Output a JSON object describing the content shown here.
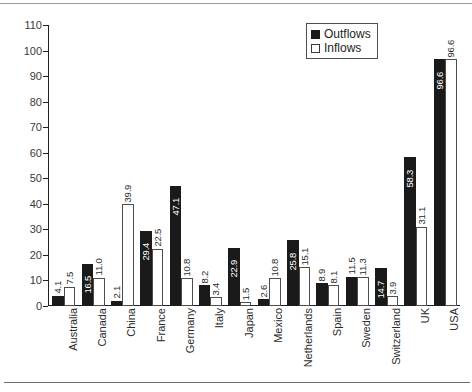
{
  "chart_data": {
    "type": "bar",
    "title": "",
    "subtitle": "",
    "xlabel": "",
    "ylabel": "",
    "ylim": [
      0,
      110
    ],
    "ytick_step": 10,
    "yticks": [
      0,
      10,
      20,
      30,
      40,
      50,
      60,
      70,
      80,
      90,
      100,
      110
    ],
    "grid": false,
    "legend_position": "top-right",
    "categories": [
      "Australia",
      "Canada",
      "China",
      "France",
      "Germany",
      "Italy",
      "Japan",
      "Mexico",
      "Netherlands",
      "Spain",
      "Sweden",
      "Switzerland",
      "UK",
      "USA"
    ],
    "series": [
      {
        "name": "Outflows",
        "color": "#1a1a1a",
        "values": [
          4.1,
          16.5,
          2.1,
          29.4,
          47.1,
          8.2,
          22.9,
          2.6,
          25.8,
          8.9,
          11.5,
          14.7,
          58.3,
          96.6
        ],
        "labels": [
          "4.1",
          "16.5",
          "2.1",
          "29.4",
          "47.1",
          "8.2",
          "22.9",
          "2.6",
          "25.8",
          "8.9",
          "11.5",
          "14.7",
          "58.3",
          "96.6"
        ]
      },
      {
        "name": "Inflows",
        "color": "#ffffff",
        "values": [
          7.5,
          11.0,
          39.9,
          22.5,
          10.8,
          3.4,
          1.5,
          10.8,
          15.1,
          8.1,
          11.3,
          3.9,
          31.1,
          96.6
        ],
        "labels": [
          "7.5",
          "11.0",
          "39.9",
          "22.5",
          "10.8",
          "3.4",
          "1.5",
          "10.8",
          "15.1",
          "8.1",
          "11.3",
          "3.9",
          "31.1",
          "96.6"
        ]
      }
    ]
  },
  "legend": {
    "entries": [
      {
        "label": "Outflows",
        "swatch": "filled-square-icon"
      },
      {
        "label": "Inflows",
        "swatch": "outline-square-icon"
      }
    ]
  }
}
